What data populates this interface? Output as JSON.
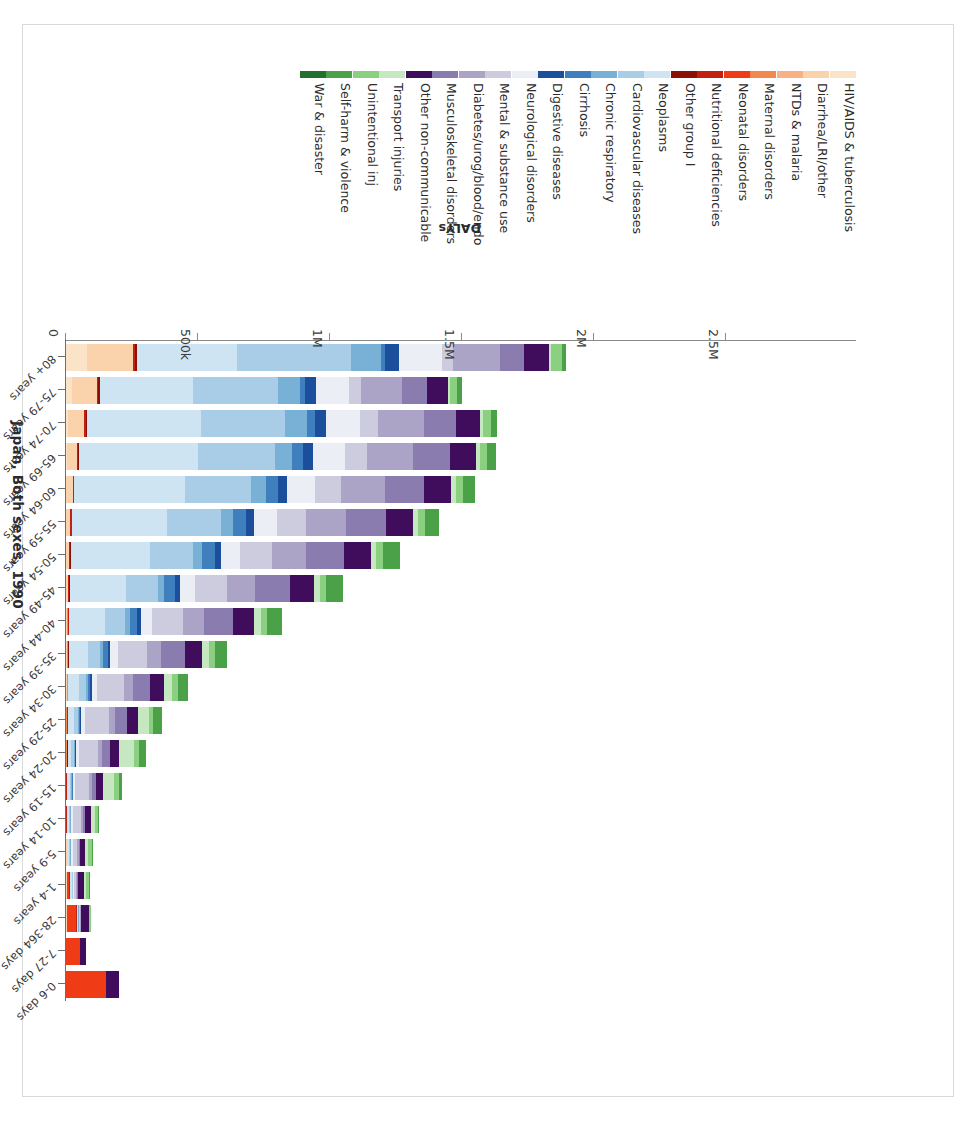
{
  "title": "Japan, Both sexes, 1990",
  "axis": {
    "x_title": "DALYs",
    "x_ticklabels": [
      "2.5M",
      "2M",
      "1.5M",
      "1M",
      "500k",
      "0"
    ],
    "x_tickvalues": [
      2500000,
      2000000,
      1500000,
      1000000,
      500000,
      0
    ],
    "x_reversed": true,
    "y_title": ""
  },
  "legend": {
    "items": [
      {
        "label": "HIV/AIDS & tuberculosis",
        "color": "#fbe3c7"
      },
      {
        "label": "Diarrhea/LRI/other",
        "color": "#fad2ab"
      },
      {
        "label": "NTDs & malaria",
        "color": "#f7b183"
      },
      {
        "label": "Maternal disorders",
        "color": "#f2884b"
      },
      {
        "label": "Neonatal disorders",
        "color": "#f03b17"
      },
      {
        "label": "Nutritional deficiencies",
        "color": "#c42012"
      },
      {
        "label": "Other group I",
        "color": "#8c1009"
      },
      {
        "label": "Neoplasms",
        "color": "#cfe4f2"
      },
      {
        "label": "Cardiovascular diseases",
        "color": "#a9cde6"
      },
      {
        "label": "Chronic respiratory",
        "color": "#79b0d6"
      },
      {
        "label": "Cirrhosis",
        "color": "#3f7fbd"
      },
      {
        "label": "Digestive diseases",
        "color": "#1b4f9c"
      },
      {
        "label": "Neurological disorders",
        "color": "#eceef5"
      },
      {
        "label": "Mental & substance use",
        "color": "#cdccdf"
      },
      {
        "label": "Diabetes/urog/blood/endo",
        "color": "#aca4c6"
      },
      {
        "label": "Musculoskeletal disorders",
        "color": "#8a7cae"
      },
      {
        "label": "Other non-communicable",
        "color": "#3f0d5c"
      },
      {
        "label": "Transport injuries",
        "color": "#c6e8c0"
      },
      {
        "label": "Unintentional inj",
        "color": "#8bd081"
      },
      {
        "label": "Self-harm & violence",
        "color": "#4aa148"
      },
      {
        "label": "War & disaster",
        "color": "#22702c"
      }
    ]
  },
  "chart_data": {
    "type": "bar",
    "subtype": "stacked-horizontal",
    "title": "Japan, Both sexes, 1990",
    "xlabel": "DALYs",
    "ylabel": "",
    "xlim": [
      0,
      2700000
    ],
    "x_axis_inverted": true,
    "grid": false,
    "legend_position": "bottom",
    "categories": [
      "0-6 days",
      "7-27 days",
      "28-364 days",
      "1-4 years",
      "5-9 years",
      "10-14 years",
      "15-19 years",
      "20-24 years",
      "25-29 years",
      "30-34 years",
      "35-39 years",
      "40-44 years",
      "45-49 years",
      "50-54 years",
      "55-59 years",
      "60-64 years",
      "65-69 years",
      "70-74 years",
      "75-79 years",
      "80+ years"
    ],
    "series": [
      {
        "name": "HIV/AIDS & tuberculosis",
        "color": "#fbe3c7",
        "values": [
          0,
          0,
          0,
          0,
          0,
          0,
          0,
          0,
          0,
          0,
          0,
          0,
          0,
          0,
          0,
          0,
          3000,
          8000,
          22000,
          80000
        ]
      },
      {
        "name": "Diarrhea/LRI/other",
        "color": "#fad2ab",
        "values": [
          0,
          0,
          3000,
          3000,
          2000,
          1000,
          1000,
          1000,
          1000,
          2000,
          3000,
          5000,
          8000,
          12000,
          17000,
          25000,
          38000,
          62000,
          95000,
          175000
        ]
      },
      {
        "name": "NTDs & malaria",
        "color": "#f7b183",
        "values": [
          0,
          0,
          0,
          0,
          0,
          0,
          0,
          0,
          0,
          0,
          0,
          0,
          0,
          0,
          0,
          0,
          0,
          0,
          0,
          0
        ]
      },
      {
        "name": "Maternal disorders",
        "color": "#f2884b",
        "values": [
          0,
          0,
          0,
          0,
          0,
          0,
          0,
          2000,
          4000,
          4000,
          3000,
          2000,
          1000,
          0,
          0,
          0,
          0,
          0,
          0,
          0
        ]
      },
      {
        "name": "Neonatal disorders",
        "color": "#f03b17",
        "values": [
          150000,
          52000,
          36000,
          9000,
          0,
          0,
          0,
          0,
          0,
          0,
          0,
          0,
          0,
          0,
          0,
          0,
          0,
          0,
          0,
          0
        ]
      },
      {
        "name": "Nutritional deficiencies",
        "color": "#c42012",
        "values": [
          0,
          0,
          2000,
          2000,
          2000,
          2000,
          2000,
          2000,
          2000,
          2000,
          3000,
          3000,
          3000,
          4000,
          4000,
          4000,
          5000,
          5000,
          5000,
          6000
        ]
      },
      {
        "name": "Other group I",
        "color": "#8c1009",
        "values": [
          0,
          0,
          1000,
          1000,
          1000,
          1000,
          1000,
          1000,
          1000,
          1000,
          1000,
          2000,
          2000,
          2000,
          3000,
          3000,
          4000,
          5000,
          6000,
          8000
        ]
      },
      {
        "name": "Neoplasms",
        "color": "#cfe4f2",
        "values": [
          0,
          0,
          3000,
          7000,
          8000,
          8000,
          10000,
          14000,
          22000,
          40000,
          75000,
          135000,
          215000,
          300000,
          360000,
          420000,
          450000,
          430000,
          355000,
          380000
        ]
      },
      {
        "name": "Cardiovascular diseases",
        "color": "#a9cde6",
        "values": [
          0,
          0,
          2000,
          3000,
          3000,
          4000,
          6000,
          9000,
          15000,
          26000,
          45000,
          78000,
          120000,
          165000,
          205000,
          250000,
          290000,
          320000,
          320000,
          430000
        ]
      },
      {
        "name": "Chronic respiratory",
        "color": "#79b0d6",
        "values": [
          0,
          0,
          1000,
          2000,
          3000,
          3000,
          4000,
          5000,
          6000,
          8000,
          11000,
          16000,
          23000,
          32000,
          42000,
          55000,
          68000,
          82000,
          85000,
          115000
        ]
      },
      {
        "name": "Cirrhosis",
        "color": "#3f7fbd",
        "values": [
          0,
          0,
          0,
          0,
          0,
          0,
          1000,
          2000,
          4000,
          9000,
          18000,
          30000,
          42000,
          50000,
          52000,
          48000,
          40000,
          30000,
          18000,
          14000
        ]
      },
      {
        "name": "Digestive diseases",
        "color": "#1b4f9c",
        "values": [
          0,
          0,
          1000,
          1000,
          1000,
          1000,
          2000,
          3000,
          4000,
          6000,
          9000,
          13000,
          18000,
          23000,
          28000,
          33000,
          38000,
          42000,
          40000,
          52000
        ]
      },
      {
        "name": "Neurological disorders",
        "color": "#eceef5",
        "values": [
          0,
          0,
          2000,
          4000,
          5000,
          6000,
          8000,
          11000,
          15000,
          21000,
          30000,
          42000,
          56000,
          72000,
          88000,
          105000,
          120000,
          130000,
          125000,
          165000
        ]
      },
      {
        "name": "Mental & substance use",
        "color": "#cdccdf",
        "values": [
          0,
          0,
          1000,
          6000,
          18000,
          32000,
          52000,
          72000,
          88000,
          100000,
          110000,
          118000,
          122000,
          120000,
          112000,
          100000,
          85000,
          68000,
          48000,
          40000
        ]
      },
      {
        "name": "Diabetes/urog/blood/endo",
        "color": "#aca4c6",
        "values": [
          0,
          2000,
          4000,
          5000,
          6000,
          8000,
          11000,
          16000,
          24000,
          36000,
          54000,
          78000,
          105000,
          130000,
          150000,
          165000,
          175000,
          175000,
          155000,
          180000
        ]
      },
      {
        "name": "Musculoskeletal disorders",
        "color": "#8a7cae",
        "values": [
          0,
          0,
          1000,
          2000,
          4000,
          8000,
          16000,
          28000,
          44000,
          64000,
          88000,
          112000,
          132000,
          145000,
          150000,
          148000,
          138000,
          120000,
          95000,
          90000
        ]
      },
      {
        "name": "Other non-communicable",
        "color": "#3f0d5c",
        "values": [
          52000,
          22000,
          30000,
          22000,
          20000,
          22000,
          28000,
          36000,
          44000,
          54000,
          66000,
          80000,
          92000,
          100000,
          104000,
          104000,
          100000,
          92000,
          78000,
          95000
        ]
      },
      {
        "name": "Transport injuries",
        "color": "#c6e8c0",
        "values": [
          0,
          0,
          2000,
          8000,
          12000,
          14000,
          42000,
          58000,
          40000,
          30000,
          26000,
          24000,
          22000,
          20000,
          18000,
          16000,
          14000,
          12000,
          9000,
          8000
        ]
      },
      {
        "name": "Unintentional inj",
        "color": "#8bd081",
        "values": [
          0,
          0,
          6000,
          14000,
          14000,
          12000,
          16000,
          18000,
          18000,
          20000,
          22000,
          24000,
          26000,
          28000,
          28000,
          28000,
          28000,
          28000,
          26000,
          40000
        ]
      },
      {
        "name": "Self-harm & violence",
        "color": "#4aa148",
        "values": [
          0,
          0,
          1000,
          2000,
          2000,
          4000,
          14000,
          26000,
          34000,
          40000,
          48000,
          58000,
          64000,
          62000,
          54000,
          44000,
          34000,
          26000,
          18000,
          16000
        ]
      },
      {
        "name": "War & disaster",
        "color": "#22702c",
        "values": [
          0,
          0,
          0,
          0,
          0,
          0,
          0,
          0,
          0,
          0,
          0,
          0,
          0,
          0,
          0,
          0,
          0,
          0,
          0,
          0
        ]
      }
    ],
    "row_totals": [
      202000,
      76000,
      95000,
      91000,
      101000,
      126000,
      214000,
      304000,
      366000,
      463000,
      612000,
      820000,
      1052000,
      1265000,
      1415000,
      1548000,
      1630000,
      1637000,
      1500000,
      1894000
    ]
  }
}
